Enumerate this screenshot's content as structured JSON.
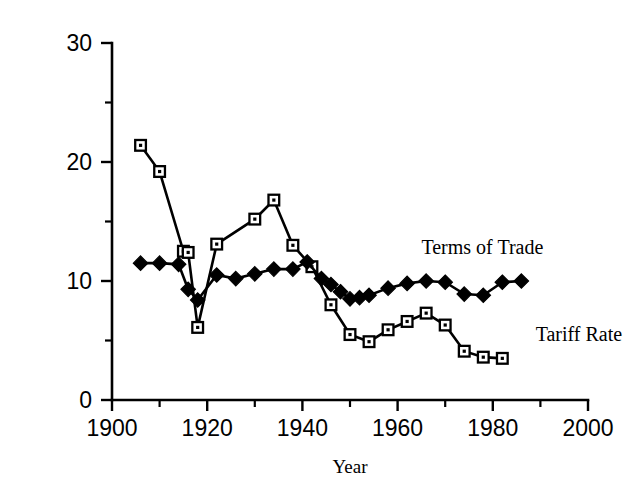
{
  "chart_data": {
    "type": "line",
    "title": "",
    "xlabel": "Year",
    "ylabel": "",
    "xlim": [
      1900,
      2000
    ],
    "ylim": [
      0,
      30
    ],
    "x_major_ticks": [
      1900,
      1920,
      1940,
      1960,
      1980,
      2000
    ],
    "x_minor_ticks": [
      1910,
      1930,
      1950,
      1970,
      1990
    ],
    "y_major_ticks": [
      0,
      10,
      20,
      30
    ],
    "y_minor_ticks": [
      5,
      15,
      25
    ],
    "x_tick_labels": [
      "1900",
      "1920",
      "1940",
      "1960",
      "1980",
      "2000"
    ],
    "y_tick_labels": [
      "0",
      "10",
      "20",
      "30"
    ],
    "grid": false,
    "legend_position": "inline-annotations",
    "series": [
      {
        "name": "Tariff Rate",
        "marker": "open-square",
        "label_x": 1989,
        "label_y": 5.0,
        "points": [
          [
            1906,
            21.4
          ],
          [
            1910,
            19.2
          ],
          [
            1915,
            12.5
          ],
          [
            1916,
            12.4
          ],
          [
            1918,
            6.1
          ],
          [
            1922,
            13.1
          ],
          [
            1930,
            15.2
          ],
          [
            1934,
            16.8
          ],
          [
            1938,
            13.0
          ],
          [
            1942,
            11.2
          ],
          [
            1946,
            8.0
          ],
          [
            1950,
            5.5
          ],
          [
            1954,
            4.9
          ],
          [
            1958,
            5.9
          ],
          [
            1962,
            6.6
          ],
          [
            1966,
            7.3
          ],
          [
            1970,
            6.3
          ],
          [
            1974,
            4.1
          ],
          [
            1978,
            3.6
          ],
          [
            1982,
            3.5
          ]
        ]
      },
      {
        "name": "Terms of Trade",
        "marker": "filled-diamond",
        "label_x": 1965,
        "label_y": 12.3,
        "points": [
          [
            1906,
            11.5
          ],
          [
            1910,
            11.5
          ],
          [
            1914,
            11.4
          ],
          [
            1916,
            9.3
          ],
          [
            1918,
            8.4
          ],
          [
            1922,
            10.5
          ],
          [
            1926,
            10.2
          ],
          [
            1930,
            10.6
          ],
          [
            1934,
            11.0
          ],
          [
            1938,
            11.0
          ],
          [
            1941,
            11.6
          ],
          [
            1944,
            10.2
          ],
          [
            1946,
            9.7
          ],
          [
            1948,
            9.1
          ],
          [
            1950,
            8.5
          ],
          [
            1952,
            8.6
          ],
          [
            1954,
            8.8
          ],
          [
            1958,
            9.4
          ],
          [
            1962,
            9.8
          ],
          [
            1966,
            10.0
          ],
          [
            1970,
            9.9
          ],
          [
            1974,
            8.9
          ],
          [
            1978,
            8.8
          ],
          [
            1982,
            9.9
          ],
          [
            1986,
            10.0
          ]
        ]
      }
    ]
  }
}
